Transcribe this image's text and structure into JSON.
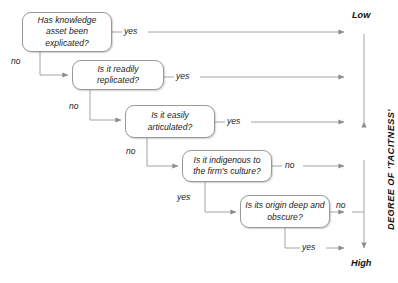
{
  "diagram": {
    "title_text": "",
    "nodes": [
      {
        "id": "n1",
        "text": "Has knowledge asset been explicated?"
      },
      {
        "id": "n2",
        "text": "Is it readily replicated?"
      },
      {
        "id": "n3",
        "text": "Is it easily articulated?"
      },
      {
        "id": "n4",
        "text": "Is it indigenous to the firm's culture?"
      },
      {
        "id": "n5",
        "text": "Is its origin deep and obscure?"
      }
    ],
    "edge_labels": {
      "n1_right": "yes",
      "n1_down": "no",
      "n2_right": "yes",
      "n2_down": "no",
      "n3_right": "yes",
      "n3_down": "no",
      "n4_right": "no",
      "n4_down": "yes",
      "n5_right": "no",
      "n5_down": "yes"
    },
    "axis": {
      "top_label": "Low",
      "bottom_label": "High",
      "title": "DEGREE OF 'TACITNESS'"
    },
    "colors": {
      "stroke": "#9a9a9a",
      "arrow": "#8c8c8c",
      "text": "#1c1c1c",
      "axis_text": "#101010",
      "background": "#ffffff"
    }
  }
}
